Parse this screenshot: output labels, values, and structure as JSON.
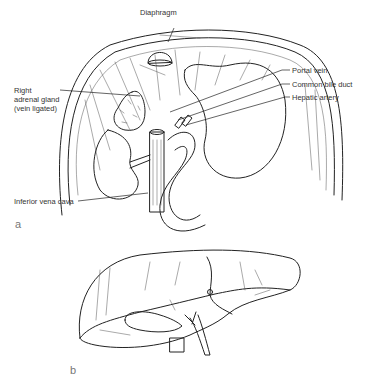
{
  "figure": {
    "panels": [
      {
        "id": "a",
        "label": "a",
        "annotations": {
          "diaphragm": "Diaphragm",
          "portal_vein": "Portal vein",
          "common_bile_duct": "Common bile duct",
          "hepatic_artery": "Hepatic artery",
          "right_adrenal_line1": "Right",
          "right_adrenal_line2": "adrenal gland",
          "right_adrenal_line3": "(vein ligated)",
          "inferior_vena_cava": "Inferior vena cava"
        }
      },
      {
        "id": "b",
        "label": "b",
        "annotations": {}
      }
    ]
  }
}
